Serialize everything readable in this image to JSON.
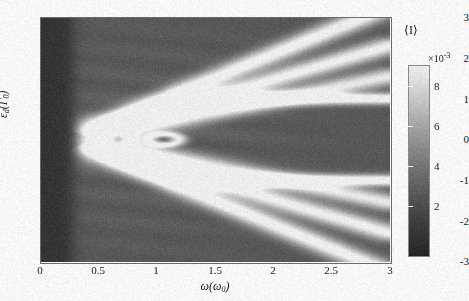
{
  "figure": {
    "kind": "heatmap-figure"
  },
  "axes": {
    "xlabel": "ω(ω₀)",
    "xlabel_main": "ω(",
    "xlabel_sub": "ω",
    "xlabel_sub2": "0",
    "xlabel_close": ")",
    "ylabel_main": "ε",
    "ylabel_sub": "d",
    "ylabel_open": "(Γ",
    "ylabel_sub2": "0",
    "ylabel_close": ")",
    "xticks": [
      "0",
      "0.5",
      "1",
      "1.5",
      "2",
      "2.5",
      "3"
    ],
    "yticks": [
      "3",
      "2",
      "1",
      "0",
      "-1",
      "-2",
      "-3"
    ]
  },
  "colorbar": {
    "title": "⟨I⟩",
    "multiplier_base": "×10",
    "multiplier_exp": "-3",
    "ticks": [
      "8",
      "6",
      "4",
      "2"
    ],
    "low_color": "#1f1f1f",
    "high_color": "#f2f2f2"
  },
  "chart_data": {
    "type": "heatmap",
    "title": "",
    "xlabel": "ω(ω₀)",
    "ylabel": "εd(Γ0)",
    "xlim": [
      0,
      3
    ],
    "ylim": [
      -3,
      3
    ],
    "colorbar_label": "⟨I⟩",
    "colorbar_scale": 0.001,
    "clim": [
      0,
      9.5
    ],
    "cticks": [
      2,
      4,
      6,
      8
    ],
    "colormap": "gray",
    "grid": false,
    "legend_position": "none",
    "background_value": 0.0022,
    "features": [
      {
        "name": "dark-left-region",
        "x_range": [
          0.0,
          0.27
        ],
        "value": 0.0012
      },
      {
        "name": "central-bright-blob",
        "x": 0.42,
        "y": 0.0,
        "peak": 0.0072,
        "sigma_x": 0.1,
        "sigma_y": 0.3
      },
      {
        "name": "ring-structure-1",
        "x": 0.66,
        "y": 0.0,
        "peak": 0.0078,
        "radius_x": 0.12,
        "radius_y": 0.28
      },
      {
        "name": "ring-structure-2",
        "x": 1.06,
        "y": 0.0,
        "peak": 0.007,
        "radius_x": 0.13,
        "radius_y": 0.13
      },
      {
        "name": "plateau-ridge-upper",
        "y": 1.0,
        "x_start": 1.55,
        "x_end": 3.0,
        "peak": 0.0094
      },
      {
        "name": "plateau-ridge-lower",
        "y": -1.0,
        "x_start": 1.55,
        "x_end": 3.0,
        "peak": 0.0094
      },
      {
        "name": "diagonal-ray-upper-steep",
        "from": [
          0.33,
          0.15
        ],
        "to": [
          3.0,
          3.25
        ],
        "peak": 0.008
      },
      {
        "name": "diagonal-ray-lower-steep",
        "from": [
          0.33,
          -0.15
        ],
        "to": [
          3.0,
          -3.25
        ],
        "peak": 0.008
      },
      {
        "name": "diagonal-ray-upper-mid",
        "from": [
          0.36,
          0.1
        ],
        "to": [
          3.0,
          2.3
        ],
        "peak": 0.0076
      },
      {
        "name": "diagonal-ray-lower-mid",
        "from": [
          0.36,
          -0.1
        ],
        "to": [
          3.0,
          -2.3
        ],
        "peak": 0.0076
      },
      {
        "name": "diagonal-ray-upper-shallow",
        "from": [
          0.45,
          0.05
        ],
        "to": [
          3.0,
          1.55
        ],
        "peak": 0.007
      },
      {
        "name": "diagonal-ray-lower-shallow",
        "from": [
          0.45,
          -0.05
        ],
        "to": [
          3.0,
          -1.55
        ],
        "peak": 0.007
      },
      {
        "name": "secondary-arm-upper",
        "from": [
          0.55,
          0.3
        ],
        "to": [
          1.3,
          1.05
        ],
        "peak": 0.0066
      },
      {
        "name": "secondary-arm-lower",
        "from": [
          0.55,
          -0.3
        ],
        "to": [
          1.3,
          -1.05
        ],
        "peak": 0.0066
      }
    ],
    "annotations": []
  }
}
